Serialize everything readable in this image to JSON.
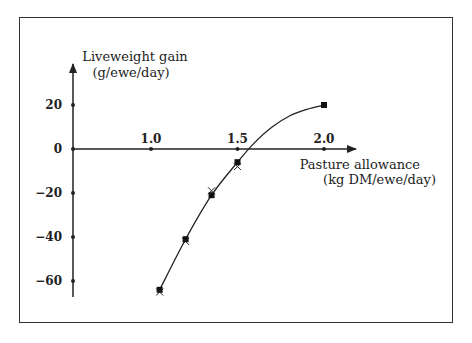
{
  "chart_data": {
    "type": "scatter",
    "title": "",
    "xlabel": "Pasture allowance (kg DM/ewe/day)",
    "ylabel": "Liveweight gain (g/ewe/day)",
    "xlabel_lines": [
      "Pasture allowance",
      "(kg DM/ewe/day)"
    ],
    "ylabel_lines": [
      "Liveweight gain",
      "(g/ewe/day)"
    ],
    "x_ticks": [
      "1.0",
      "1.5",
      "2.0"
    ],
    "x_tick_values": [
      1.0,
      1.5,
      2.0
    ],
    "y_ticks": [
      "20",
      "0",
      "−20",
      "−40",
      "−60"
    ],
    "y_tick_values": [
      20,
      0,
      -20,
      -40,
      -60
    ],
    "xlim": [
      0.55,
      2.35
    ],
    "ylim": [
      -68,
      38
    ],
    "grid": false,
    "legend": null,
    "series": [
      {
        "name": "observed (filled squares)",
        "marker": "square",
        "x": [
          1.05,
          1.2,
          1.35,
          1.5,
          2.0
        ],
        "y": [
          -64,
          -41,
          -21,
          -6,
          20
        ]
      },
      {
        "name": "observed (crosses)",
        "marker": "x",
        "x": [
          1.05,
          1.2,
          1.35,
          1.5
        ],
        "y": [
          -65,
          -42,
          -19,
          -8
        ]
      },
      {
        "name": "fitted curve",
        "marker": "line",
        "x": [
          1.05,
          1.2,
          1.35,
          1.5,
          1.6,
          1.7,
          1.8,
          1.9,
          2.0
        ],
        "y": [
          -64,
          -41,
          -21,
          -6,
          3,
          10,
          15,
          18,
          20
        ]
      }
    ]
  }
}
